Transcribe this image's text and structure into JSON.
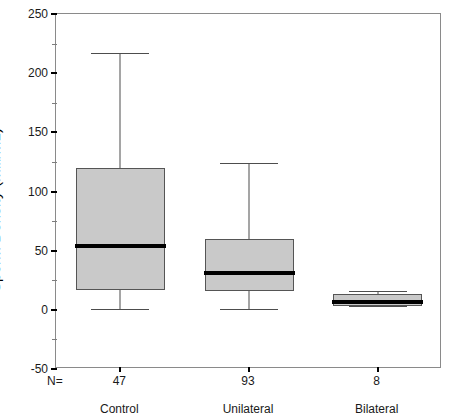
{
  "chart_data": {
    "type": "box",
    "title": "",
    "xlabel": "",
    "ylabel": "Sperm Density (mill/mL)",
    "ylim": [
      -50,
      250
    ],
    "y_major_ticks": [
      250,
      200,
      150,
      100,
      50,
      0,
      -50
    ],
    "y_minor_ticks": [
      225,
      175,
      125,
      75,
      25,
      -25
    ],
    "grid": false,
    "legend": null,
    "categories": [
      "Control",
      "Unilateral",
      "Bilateral"
    ],
    "n_prefix": "N=",
    "counts": [
      47,
      93,
      8
    ],
    "boxes": [
      {
        "category": "Control",
        "n": 47,
        "whisker_low": 1,
        "q1": 17,
        "median": 54,
        "q3": 120,
        "whisker_high": 217
      },
      {
        "category": "Unilateral",
        "n": 93,
        "whisker_low": 1,
        "q1": 16,
        "median": 31,
        "q3": 60,
        "whisker_high": 124
      },
      {
        "category": "Bilateral",
        "n": 8,
        "whisker_low": 3,
        "q1": 3,
        "median": 7,
        "q3": 13,
        "whisker_high": 16
      }
    ]
  },
  "axis": {
    "y_title": "Sperm Density (mill/mL)",
    "tick_250": "250",
    "tick_200": "200",
    "tick_150": "150",
    "tick_100": "100",
    "tick_50": "50",
    "tick_0": "0",
    "tick_neg50": "-50"
  },
  "footer": {
    "n_equals": "N=",
    "count_control": "47",
    "count_unilateral": "93",
    "count_bilateral": "8",
    "label_control": "Control",
    "label_unilateral": "Unilateral",
    "label_bilateral": "Bilateral"
  },
  "colors": {
    "box_fill": "#c9c9c9",
    "box_border": "#555555",
    "median": "#000000",
    "whisker": "#4d4d4d",
    "frame": "#8a8a8a",
    "text": "#1a1a1a",
    "background": "#ffffff"
  }
}
